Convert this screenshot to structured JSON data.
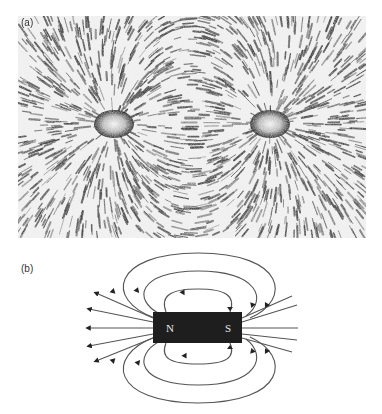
{
  "figure": {
    "panels": [
      {
        "id": "a",
        "label": "(a)",
        "description": "Photograph of iron filings aligned along the magnetic field of a bar magnet, showing two pole concentrations"
      },
      {
        "id": "b",
        "label": "(b)",
        "description": "Diagram of magnetic field lines around a bar magnet"
      }
    ],
    "magnet": {
      "north_label": "N",
      "south_label": "S",
      "color": "#1e1e1e"
    },
    "field_line_color": "#555555",
    "loops_above": 3,
    "loops_below": 3,
    "radial_lines_per_side": 5
  }
}
